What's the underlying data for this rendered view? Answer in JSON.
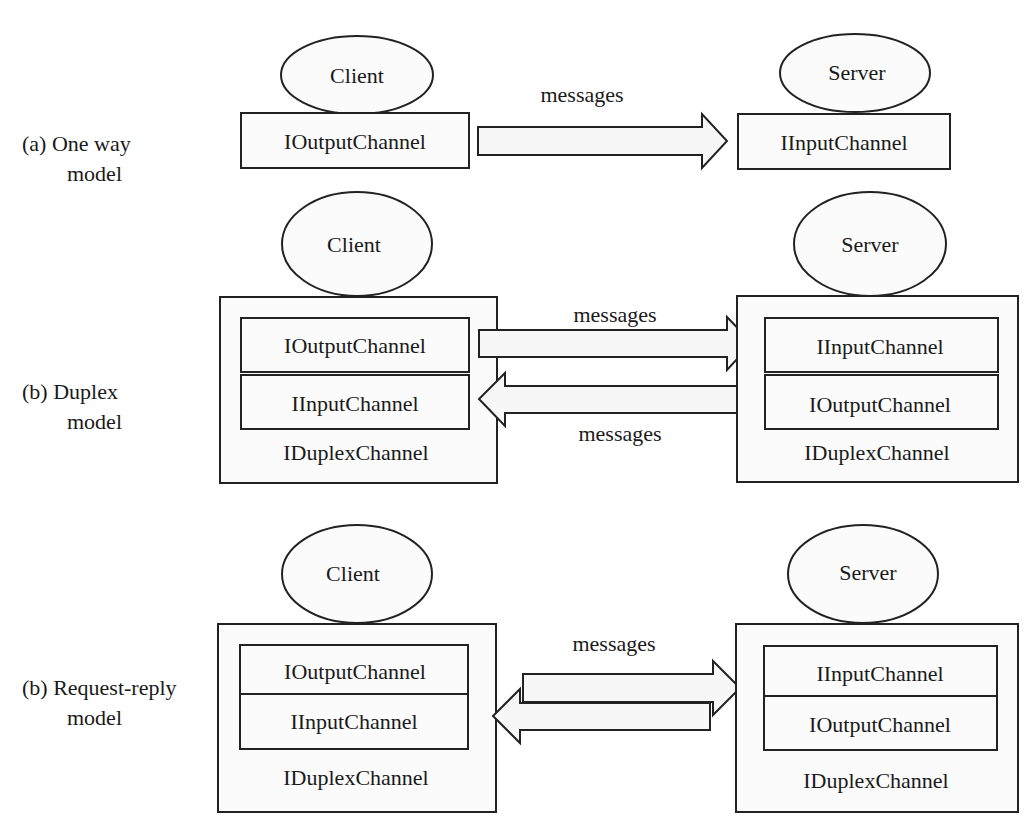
{
  "colors": {
    "background": "#ffffff",
    "stroke": "#222222",
    "fill": "#fbfbfb",
    "text": "#1a1a1a"
  },
  "sections": {
    "one_way": {
      "label_line1": "(a) One way",
      "label_line2": "model",
      "client": {
        "name": "Client",
        "channel": "IOutputChannel"
      },
      "server": {
        "name": "Server",
        "channel": "IInputChannel"
      },
      "arrow_label": "messages"
    },
    "duplex": {
      "label_line1": "(b) Duplex",
      "label_line2": "model",
      "client": {
        "name": "Client",
        "channels": [
          "IOutputChannel",
          "IInputChannel"
        ],
        "container": "IDuplexChannel"
      },
      "server": {
        "name": "Server",
        "channels": [
          "IInputChannel",
          "IOutputChannel"
        ],
        "container": "IDuplexChannel"
      },
      "arrow_label_top": "messages",
      "arrow_label_bottom": "messages"
    },
    "request_reply": {
      "label_line1": "(b) Request-reply",
      "label_line2": "model",
      "client": {
        "name": "Client",
        "channels": [
          "IOutputChannel",
          "IInputChannel"
        ],
        "container": "IDuplexChannel"
      },
      "server": {
        "name": "Server",
        "channels": [
          "IInputChannel",
          "IOutputChannel"
        ],
        "container": "IDuplexChannel"
      },
      "arrow_label": "messages"
    }
  }
}
